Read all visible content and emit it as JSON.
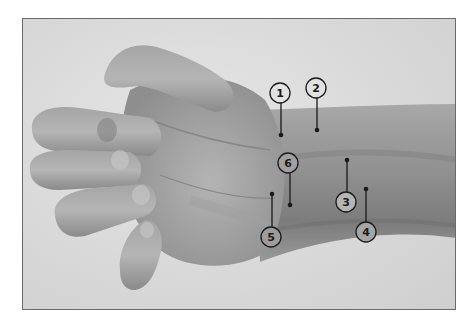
{
  "figure": {
    "background_color": "#dcdcdc",
    "skin_color": "#9a9a9a",
    "callout_color": "#1a1a1a",
    "callouts": [
      {
        "label": "1",
        "circle": [
          280,
          93
        ],
        "dot": [
          281,
          135
        ]
      },
      {
        "label": "2",
        "circle": [
          316,
          88
        ],
        "dot": [
          317,
          130
        ]
      },
      {
        "label": "3",
        "circle": [
          346,
          202
        ],
        "dot": [
          347,
          160
        ]
      },
      {
        "label": "4",
        "circle": [
          366,
          232
        ],
        "dot": [
          366,
          189
        ]
      },
      {
        "label": "5",
        "circle": [
          271,
          237
        ],
        "dot": [
          272,
          194
        ]
      },
      {
        "label": "6",
        "circle": [
          288,
          163
        ],
        "dot": [
          290,
          205
        ]
      }
    ]
  }
}
